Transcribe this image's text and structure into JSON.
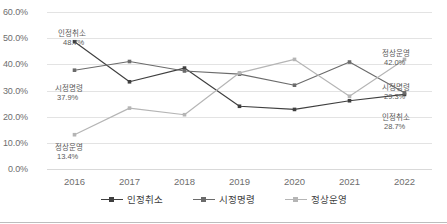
{
  "chart_data": {
    "type": "line",
    "title": "",
    "subtitle": "",
    "xlabel": "",
    "ylabel": "",
    "categories": [
      "2016",
      "2017",
      "2018",
      "2019",
      "2020",
      "2021",
      "2022"
    ],
    "ylim": [
      0,
      60
    ],
    "ytick_labels": [
      "0.0%",
      "10.0%",
      "20.0%",
      "30.0%",
      "40.0%",
      "50.0%",
      "60.0%"
    ],
    "ytick_values": [
      0,
      10,
      20,
      30,
      40,
      50,
      60
    ],
    "grid": true,
    "legend_position": "bottom",
    "series": [
      {
        "name": "인정취소",
        "color": "#3f3f3f",
        "values": [
          48.7,
          33.5,
          38.7,
          24.2,
          23.0,
          26.3,
          28.7
        ]
      },
      {
        "name": "시정명령",
        "color": "#6b6b6b",
        "values": [
          37.9,
          41.2,
          37.6,
          36.4,
          32.2,
          41.0,
          29.3
        ]
      },
      {
        "name": "정상운영",
        "color": "#b5b5b5",
        "values": [
          13.4,
          23.5,
          21.0,
          36.9,
          42.0,
          28.0,
          42.0
        ]
      }
    ],
    "annotations": [
      {
        "series": "인정취소",
        "category": "2016",
        "name": "인정취소",
        "value": "48.7%",
        "side": "left"
      },
      {
        "series": "시정명령",
        "category": "2016",
        "name": "시정명령",
        "value": "37.9%",
        "side": "left"
      },
      {
        "series": "정상운영",
        "category": "2016",
        "name": "정상운영",
        "value": "13.4%",
        "side": "left"
      },
      {
        "series": "정상운영",
        "category": "2022",
        "name": "정상운영",
        "value": "42.0%",
        "side": "right"
      },
      {
        "series": "시정명령",
        "category": "2022",
        "name": "시정명령",
        "value": "29.3%",
        "side": "right"
      },
      {
        "series": "인정취소",
        "category": "2022",
        "name": "인정취소",
        "value": "28.7%",
        "side": "right"
      }
    ]
  },
  "legend": {
    "items": [
      {
        "label": "인정취소",
        "color": "#3f3f3f"
      },
      {
        "label": "시정명령",
        "color": "#6b6b6b"
      },
      {
        "label": "정상운영",
        "color": "#b5b5b5"
      }
    ]
  }
}
